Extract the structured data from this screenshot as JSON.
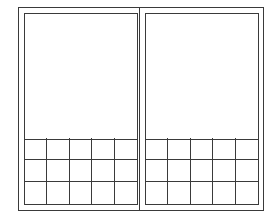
{
  "diagram": {
    "line_color": "#3a3a3a",
    "background": "#ffffff",
    "panels": [
      {
        "name": "left",
        "grid": {
          "columns": 5,
          "rows": 3
        }
      },
      {
        "name": "right",
        "grid": {
          "columns": 5,
          "rows": 3
        }
      }
    ]
  }
}
